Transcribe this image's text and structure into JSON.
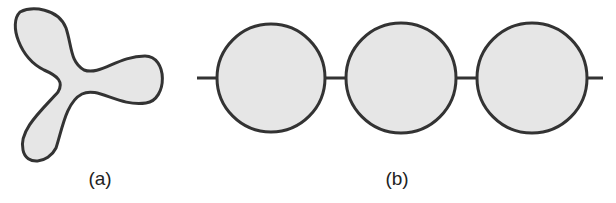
{
  "figure": {
    "panels": [
      {
        "id": "a",
        "label": "(a)",
        "shape": "three-lobed blob",
        "fill": "#e6e6e6",
        "stroke": "#333333"
      },
      {
        "id": "b",
        "label": "(b)",
        "shape": "three circles connected by a line",
        "circle_count": 3,
        "fill": "#e6e6e6",
        "stroke": "#333333"
      }
    ]
  }
}
